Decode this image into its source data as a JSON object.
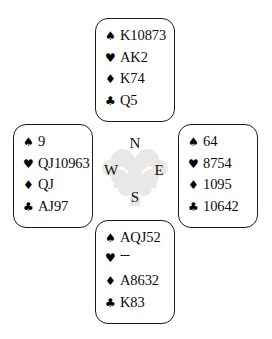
{
  "diagram": {
    "type": "bridge-hand-diagram",
    "background_color": "#ffffff",
    "text_color": "#0d0d0d",
    "border_color": "#1b1b1b"
  },
  "compass": {
    "north_label": "N",
    "south_label": "S",
    "west_label": "W",
    "east_label": "E",
    "watermark": "suit-symbols-cluster",
    "watermark_color": "#b9b4ae"
  },
  "suit_symbols": {
    "spade": "♠",
    "heart": "♥",
    "diamond": "♦",
    "club": "♣"
  },
  "hands": {
    "north": {
      "position_label": "North",
      "spades": "K10873",
      "hearts": "AK2",
      "diamonds": "K74",
      "clubs": "Q5"
    },
    "west": {
      "position_label": "West",
      "spades": "9",
      "hearts": "QJ10963",
      "diamonds": "QJ",
      "clubs": "AJ97"
    },
    "east": {
      "position_label": "East",
      "spades": "64",
      "hearts": "8754",
      "diamonds": "1095",
      "clubs": "10642"
    },
    "south": {
      "position_label": "South",
      "spades": "AQJ52",
      "hearts": "---",
      "diamonds": "A8632",
      "clubs": "K83"
    }
  }
}
